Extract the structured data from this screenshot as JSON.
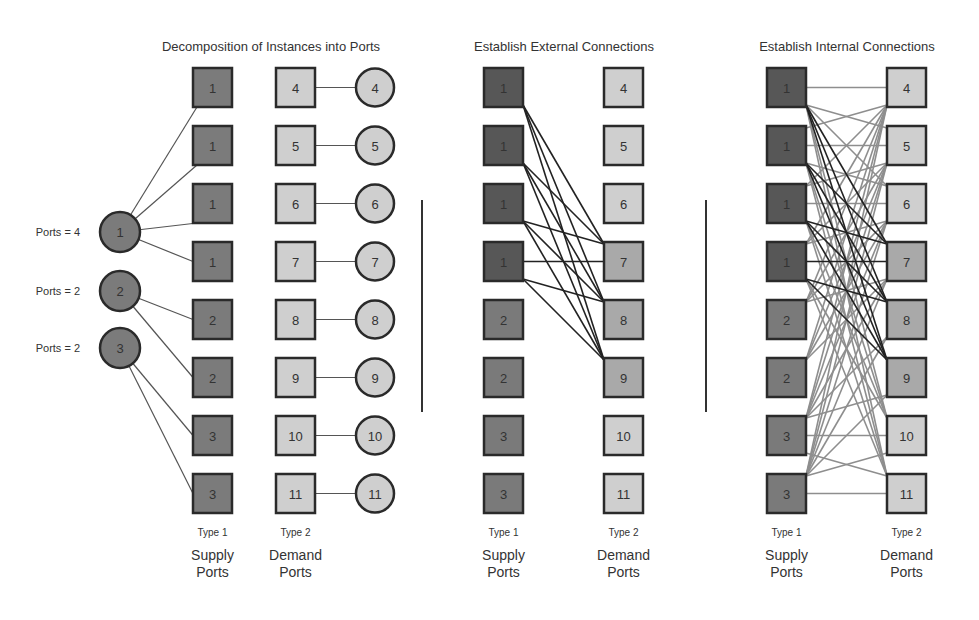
{
  "colors": {
    "supply_left": "#7b7b7b",
    "supply_dark": "#575757",
    "supply_mid": "#7a7a7a",
    "demand_light": "#cfcfcf",
    "demand_mid": "#a9a9a9",
    "instance_supply": "#7b7b7b",
    "instance_demand": "#cfcfcf",
    "stroke": "#2a2a2a",
    "edge_thin": "#555555",
    "edge_external": "#222222",
    "edge_internal": "#8e8e8e",
    "divider": "#333333",
    "text": "#333333"
  },
  "panels": [
    {
      "id": "decomposition",
      "title": "Decomposition of Instances into Ports",
      "supply_labels": [
        "1",
        "1",
        "1",
        "1",
        "2",
        "2",
        "3",
        "3"
      ],
      "demand_labels": [
        "4",
        "5",
        "6",
        "7",
        "8",
        "9",
        "10",
        "11"
      ],
      "supply_type": "Type 1",
      "demand_type": "Type 2",
      "supply_caption": [
        "Supply",
        "Ports"
      ],
      "demand_caption": [
        "Demand",
        "Ports"
      ],
      "supply_instances": [
        {
          "label": "1",
          "ports_text": "Ports = 4",
          "connects_to": [
            0,
            1,
            2,
            3
          ]
        },
        {
          "label": "2",
          "ports_text": "Ports = 2",
          "connects_to": [
            4,
            5
          ]
        },
        {
          "label": "3",
          "ports_text": "Ports = 2",
          "connects_to": [
            6,
            7
          ]
        }
      ],
      "demand_instances": [
        "4",
        "5",
        "6",
        "7",
        "8",
        "9",
        "10",
        "11"
      ]
    },
    {
      "id": "external",
      "title": "Establish External Connections",
      "supply_labels": [
        "1",
        "1",
        "1",
        "1",
        "2",
        "2",
        "3",
        "3"
      ],
      "demand_labels": [
        "4",
        "5",
        "6",
        "7",
        "8",
        "9",
        "10",
        "11"
      ],
      "supply_type": "Type 1",
      "demand_type": "Type 2",
      "supply_caption": [
        "Supply",
        "Ports"
      ],
      "demand_caption": [
        "Demand",
        "Ports"
      ],
      "external_edges": [
        [
          0,
          3
        ],
        [
          0,
          4
        ],
        [
          0,
          5
        ],
        [
          1,
          3
        ],
        [
          1,
          4
        ],
        [
          1,
          5
        ],
        [
          2,
          3
        ],
        [
          2,
          4
        ],
        [
          2,
          5
        ],
        [
          3,
          3
        ],
        [
          3,
          4
        ],
        [
          3,
          5
        ]
      ]
    },
    {
      "id": "internal",
      "title": "Establish Internal Connections",
      "supply_labels": [
        "1",
        "1",
        "1",
        "1",
        "2",
        "2",
        "3",
        "3"
      ],
      "demand_labels": [
        "4",
        "5",
        "6",
        "7",
        "8",
        "9",
        "10",
        "11"
      ],
      "supply_type": "Type 1",
      "demand_type": "Type 2",
      "supply_caption": [
        "Supply",
        "Ports"
      ],
      "demand_caption": [
        "Demand",
        "Ports"
      ],
      "external_edges": [
        [
          0,
          3
        ],
        [
          0,
          4
        ],
        [
          0,
          5
        ],
        [
          1,
          3
        ],
        [
          1,
          4
        ],
        [
          1,
          5
        ],
        [
          2,
          3
        ],
        [
          2,
          4
        ],
        [
          2,
          5
        ],
        [
          3,
          3
        ],
        [
          3,
          4
        ],
        [
          3,
          5
        ]
      ],
      "internal_edges": [
        [
          0,
          0
        ],
        [
          0,
          1
        ],
        [
          0,
          2
        ],
        [
          0,
          6
        ],
        [
          0,
          7
        ],
        [
          1,
          0
        ],
        [
          1,
          1
        ],
        [
          1,
          2
        ],
        [
          1,
          6
        ],
        [
          1,
          7
        ],
        [
          2,
          0
        ],
        [
          2,
          1
        ],
        [
          2,
          2
        ],
        [
          2,
          6
        ],
        [
          2,
          7
        ],
        [
          3,
          0
        ],
        [
          3,
          1
        ],
        [
          3,
          2
        ],
        [
          3,
          6
        ],
        [
          3,
          7
        ],
        [
          4,
          0
        ],
        [
          4,
          1
        ],
        [
          4,
          2
        ],
        [
          4,
          3
        ],
        [
          5,
          0
        ],
        [
          5,
          1
        ],
        [
          5,
          2
        ],
        [
          5,
          3
        ],
        [
          6,
          0
        ],
        [
          6,
          1
        ],
        [
          6,
          2
        ],
        [
          6,
          3
        ],
        [
          6,
          4
        ],
        [
          6,
          5
        ],
        [
          6,
          6
        ],
        [
          6,
          7
        ],
        [
          7,
          0
        ],
        [
          7,
          1
        ],
        [
          7,
          2
        ],
        [
          7,
          3
        ],
        [
          7,
          4
        ],
        [
          7,
          5
        ],
        [
          7,
          6
        ],
        [
          7,
          7
        ]
      ]
    }
  ]
}
